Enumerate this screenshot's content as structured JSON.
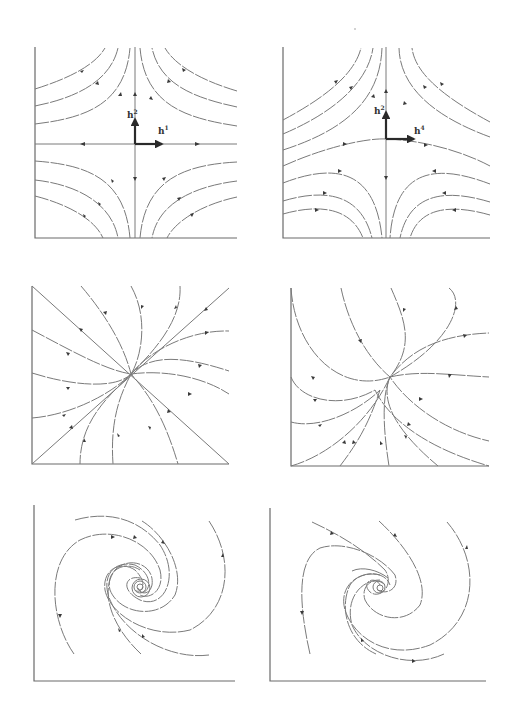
{
  "figure": {
    "panels": [
      {
        "id": "saddle-a",
        "type": "saddle",
        "row": 1,
        "col": 1,
        "eigenvector_labels": {
          "vertical": "h",
          "vertical_sup": "2",
          "horizontal": "h",
          "horizontal_sup": "1"
        }
      },
      {
        "id": "saddle-b",
        "type": "saddle",
        "row": 1,
        "col": 2,
        "eigenvector_labels": {
          "vertical": "h",
          "vertical_sup": "2",
          "horizontal": "h",
          "horizontal_sup": "4"
        }
      },
      {
        "id": "node-a",
        "type": "stable-node",
        "row": 2,
        "col": 1
      },
      {
        "id": "node-b",
        "type": "stable-node",
        "row": 2,
        "col": 2
      },
      {
        "id": "spiral-a",
        "type": "stable-spiral",
        "row": 3,
        "col": 1
      },
      {
        "id": "spiral-b",
        "type": "stable-spiral",
        "row": 3,
        "col": 2
      }
    ]
  }
}
